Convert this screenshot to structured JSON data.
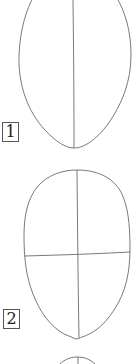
{
  "diagram": {
    "type": "drawing-tutorial-steps",
    "stroke_color": "#6a6a6a",
    "steps": [
      {
        "label": "1",
        "description": "egg-shaped head outline with vertical center line"
      },
      {
        "label": "2",
        "description": "egg-shaped head outline with vertical and horizontal guide lines"
      },
      {
        "label": "",
        "description": "partially visible next-step outline"
      }
    ]
  }
}
